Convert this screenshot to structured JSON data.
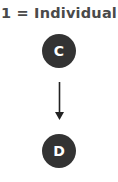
{
  "title": "1 = Individual",
  "nodes": [
    {
      "id": "C",
      "label": "C"
    },
    {
      "id": "D",
      "label": "D"
    }
  ],
  "edges": [
    {
      "from": "C",
      "to": "D",
      "directed": true
    }
  ],
  "colors": {
    "node_fill": "#333333",
    "node_text": "#ffffff",
    "title_text": "#4a4a4a",
    "edge": "#222222"
  }
}
